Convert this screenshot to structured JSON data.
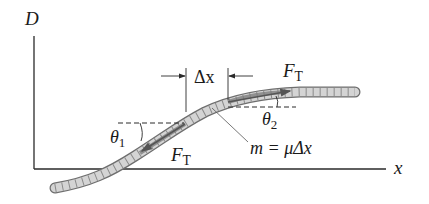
{
  "diagram": {
    "axes": {
      "y_label": "D",
      "x_label": "x"
    },
    "labels": {
      "delta_x": "Δx",
      "theta1_symbol": "θ",
      "theta1_sub": "1",
      "theta2_symbol": "θ",
      "theta2_sub": "2",
      "force_top_symbol": "F",
      "force_top_sub": "T",
      "force_bottom_symbol": "F",
      "force_bottom_sub": "T",
      "mass_eq": "m = μΔx"
    },
    "colors": {
      "line": "#2a2a2a",
      "rope_fill": "#d4d4d4",
      "rope_edge": "#6e6e6e",
      "rope_segment": "#8a8a8a",
      "highlight": "#7a7a7a"
    }
  }
}
